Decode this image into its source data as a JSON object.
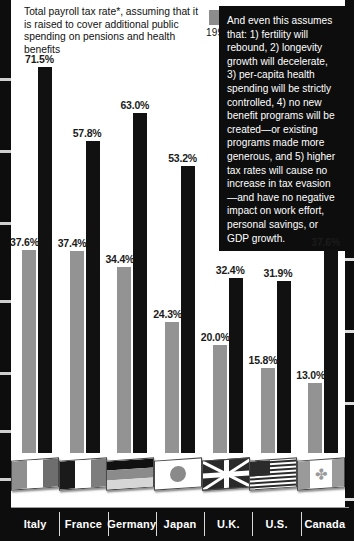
{
  "header": {
    "title": "Total payroll tax rate*, assuming that it is raised to cover additional public spending on pensions and health benefits"
  },
  "legend": {
    "series": [
      {
        "label": "1995",
        "color": "#8c8c8c",
        "swatch_name": "legend-swatch-1995"
      },
      {
        "label": "2030",
        "color": "#141414",
        "swatch_name": "legend-swatch-2030"
      }
    ]
  },
  "callout": {
    "text": "And even this assumes that: 1) fertility will rebound, 2) longevity growth will decelerate, 3) per-capita health spending will be strictly controlled, 4) no new benefit programs will be created—or existing programs made more generous, and 5) higher tax rates will cause no increase in tax evasion—and have no negative impact on work effort, personal savings, or GDP growth."
  },
  "chart_data": {
    "type": "bar",
    "title": "Total payroll tax rate*, assuming that it is raised to cover additional public spending on pensions and health benefits",
    "xlabel": "",
    "ylabel": "",
    "ylim": [
      0,
      75
    ],
    "grid": false,
    "legend_position": "top-center",
    "categories": [
      "Italy",
      "France",
      "Germany",
      "Japan",
      "U.K.",
      "U.S.",
      "Canada"
    ],
    "series": [
      {
        "name": "1995",
        "color": "#939393",
        "values": [
          37.6,
          37.4,
          34.4,
          24.3,
          20.0,
          15.8,
          13.0
        ],
        "labels": [
          "37.6%",
          "37.4%",
          "34.4%",
          "24.3%",
          "20.0%",
          "15.8%",
          "13.0%"
        ]
      },
      {
        "name": "2030",
        "color": "#111111",
        "values": [
          71.5,
          57.8,
          63.0,
          53.2,
          32.4,
          31.9,
          37.6
        ],
        "labels": [
          "71.5%",
          "57.8%",
          "63.0%",
          "53.2%",
          "32.4%",
          "31.9%",
          "37.6%"
        ]
      }
    ]
  },
  "flags": [
    {
      "country": "Italy",
      "icon": "flag-italy-icon",
      "bands": "vertical",
      "colors": [
        "#8f8f8f",
        "#ffffff",
        "#6e6e6e"
      ]
    },
    {
      "country": "France",
      "icon": "flag-france-icon",
      "bands": "vertical",
      "colors": [
        "#1a1a1a",
        "#ffffff",
        "#7d7d7d"
      ]
    },
    {
      "country": "Germany",
      "icon": "flag-germany-icon",
      "bands": "horizontal",
      "colors": [
        "#111111",
        "#8b8b8b",
        "#d6d6d6"
      ]
    },
    {
      "country": "Japan",
      "icon": "flag-japan-icon",
      "bands": "disc",
      "colors": [
        "#ffffff",
        "#8a8a8a"
      ]
    },
    {
      "country": "U.K.",
      "icon": "flag-uk-icon",
      "bands": "union",
      "colors": [
        "#2a2a2a",
        "#ffffff"
      ]
    },
    {
      "country": "U.S.",
      "icon": "flag-us-icon",
      "bands": "stars-stripes",
      "colors": [
        "#ffffff",
        "#2b2b2b"
      ]
    },
    {
      "country": "Canada",
      "icon": "flag-canada-icon",
      "bands": "maple",
      "colors": [
        "#9a9a9a",
        "#ffffff"
      ]
    }
  ],
  "footer": {
    "labels": [
      "Italy",
      "France",
      "Germany",
      "Japan",
      "U.K.",
      "U.S.",
      "Canada"
    ]
  },
  "colors": {
    "bar_1995": "#939393",
    "bar_2030": "#111111",
    "callout_bg": "#0d0d0d",
    "callout_text": "#ffffff",
    "namebar_bg": "#0d0d0d"
  }
}
